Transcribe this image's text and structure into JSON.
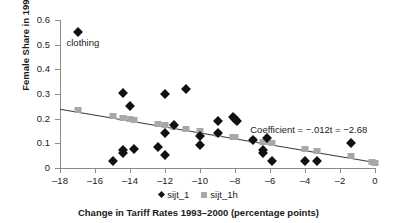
{
  "chart_data": {
    "type": "scatter",
    "title": "",
    "xlabel": "Change in Tariff Rates 1993–2000 (percentage points)",
    "ylabel": "Female Share in 1990",
    "xlim": [
      -18,
      0
    ],
    "ylim": [
      0,
      0.6
    ],
    "xticks": [
      -18,
      -16,
      -14,
      -12,
      -10,
      -8,
      -6,
      -4,
      -2,
      0
    ],
    "xticklabels": [
      "–18",
      "–16",
      "–14",
      "–12",
      "–10",
      "–8",
      "–6",
      "–4",
      "–2",
      "0"
    ],
    "yticks": [
      0,
      0.1,
      0.2,
      0.3,
      0.4,
      0.5,
      0.6
    ],
    "yticklabels": [
      "0",
      "0.1",
      "0.2",
      "0.3",
      "0.4",
      "0.5",
      "0.6"
    ],
    "grid": false,
    "legend_position": "bottom",
    "series": [
      {
        "name": "sijt_1",
        "marker": "diamond",
        "color": "#111111",
        "points": [
          [
            -17.0,
            0.553
          ],
          [
            -15.0,
            0.03
          ],
          [
            -14.4,
            0.305
          ],
          [
            -14.4,
            0.075
          ],
          [
            -14.4,
            0.062
          ],
          [
            -14.0,
            0.25
          ],
          [
            -13.8,
            0.077
          ],
          [
            -12.4,
            0.085
          ],
          [
            -12.0,
            0.302
          ],
          [
            -12.0,
            0.14
          ],
          [
            -12.0,
            0.052
          ],
          [
            -11.5,
            0.175
          ],
          [
            -10.8,
            0.32
          ],
          [
            -10.0,
            0.128
          ],
          [
            -10.0,
            0.092
          ],
          [
            -9.0,
            0.192
          ],
          [
            -9.0,
            0.14
          ],
          [
            -8.1,
            0.205
          ],
          [
            -8.0,
            0.198
          ],
          [
            -7.9,
            0.192
          ],
          [
            -7.0,
            0.115
          ],
          [
            -6.4,
            0.072
          ],
          [
            -6.4,
            0.062
          ],
          [
            -6.2,
            0.122
          ],
          [
            -5.9,
            0.03
          ],
          [
            -4.0,
            0.028
          ],
          [
            -3.3,
            0.03
          ],
          [
            -1.4,
            0.1
          ]
        ]
      },
      {
        "name": "sijt_1h",
        "marker": "square",
        "color": "#a8a8a8",
        "points": [
          [
            -17.0,
            0.237
          ],
          [
            -15.0,
            0.209
          ],
          [
            -14.4,
            0.203
          ],
          [
            -14.0,
            0.198
          ],
          [
            -13.8,
            0.196
          ],
          [
            -12.4,
            0.178
          ],
          [
            -12.0,
            0.174
          ],
          [
            -11.5,
            0.168
          ],
          [
            -10.8,
            0.159
          ],
          [
            -10.0,
            0.15
          ],
          [
            -9.0,
            0.138
          ],
          [
            -8.1,
            0.127
          ],
          [
            -8.0,
            0.126
          ],
          [
            -7.0,
            0.114
          ],
          [
            -6.4,
            0.107
          ],
          [
            -6.2,
            0.104
          ],
          [
            -5.9,
            0.101
          ],
          [
            -4.0,
            0.078
          ],
          [
            -3.3,
            0.07
          ],
          [
            -1.4,
            0.047
          ],
          [
            -0.2,
            0.024
          ],
          [
            0.0,
            0.022
          ]
        ]
      }
    ],
    "trendline": {
      "x": [
        -18,
        0
      ],
      "y": [
        0.238,
        0.022
      ]
    },
    "annotations": [
      {
        "name": "clothing",
        "text": "clothing",
        "x": -17.0,
        "y": 0.51
      },
      {
        "name": "coefficient",
        "text": "Coefficient = −.012t = −2.68",
        "x": -7.3,
        "y": 0.16
      }
    ]
  },
  "legend": {
    "entries": [
      {
        "label": "sijt_1",
        "marker": "diamond"
      },
      {
        "label": "sijt_1h",
        "marker": "square"
      }
    ]
  }
}
